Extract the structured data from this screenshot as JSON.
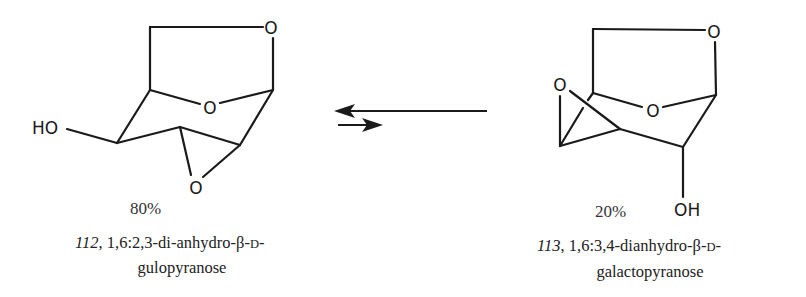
{
  "figure": {
    "type": "equilibrium",
    "direction_favored": "left",
    "arrows": {
      "forward": "short-right-arrow",
      "reverse": "long-left-arrow"
    }
  },
  "left_compound": {
    "number": "112",
    "name_part1": ", 1,6:2,3-di-anhydro-β-",
    "name_sc": "D",
    "name_part1_end": "-",
    "name_line2": "gulopyranose",
    "percentage": "80%",
    "atoms": {
      "top_O": "O",
      "ring_O": "O",
      "epoxide_O": "O",
      "hydroxyl": "HO"
    }
  },
  "right_compound": {
    "number": "113",
    "name_part1": ", 1,6:3,4-dianhydro-β-",
    "name_sc": "D",
    "name_part1_end": "-",
    "name_line2": "galactopyranose",
    "percentage": "20%",
    "atoms": {
      "top_O": "O",
      "ring_O": "O",
      "epoxide_O": "O",
      "hydroxyl": "OH"
    }
  }
}
